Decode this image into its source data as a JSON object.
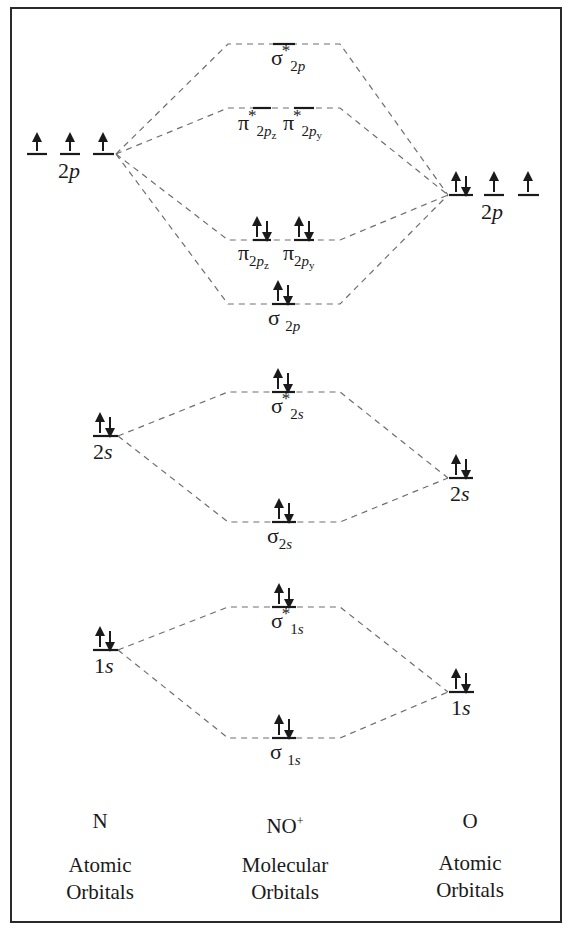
{
  "diagram": {
    "title_left": "N",
    "title_center": "NO",
    "title_center_charge": "+",
    "title_right": "O",
    "caption_left": [
      "Atomic",
      "Orbitals"
    ],
    "caption_center": [
      "Molecular",
      "Orbitals"
    ],
    "caption_right": [
      "Atomic",
      "Orbitals"
    ]
  },
  "atomic_orbitals": {
    "N": [
      {
        "name": "2p",
        "n": "2",
        "l": "p",
        "electrons": [
          "up",
          "up",
          "up"
        ]
      },
      {
        "name": "2s",
        "n": "2",
        "l": "s",
        "electrons": [
          "up-down"
        ]
      },
      {
        "name": "1s",
        "n": "1",
        "l": "s",
        "electrons": [
          "up-down"
        ]
      }
    ],
    "O": [
      {
        "name": "2p",
        "n": "2",
        "l": "p",
        "electrons": [
          "up-down",
          "up",
          "up"
        ]
      },
      {
        "name": "2s",
        "n": "2",
        "l": "s",
        "electrons": [
          "up-down"
        ]
      },
      {
        "name": "1s",
        "n": "1",
        "l": "s",
        "electrons": [
          "up-down"
        ]
      }
    ]
  },
  "molecular_orbitals": [
    {
      "symbol": "σ",
      "sub": "2p",
      "antibonding": true,
      "electrons": "empty"
    },
    {
      "symbol": "π",
      "sub": "2pz",
      "antibonding": true,
      "electrons": "empty"
    },
    {
      "symbol": "π",
      "sub": "2py",
      "antibonding": true,
      "electrons": "empty"
    },
    {
      "symbol": "π",
      "sub": "2pz",
      "antibonding": false,
      "electrons": "up-down"
    },
    {
      "symbol": "π",
      "sub": "2py",
      "antibonding": false,
      "electrons": "up-down"
    },
    {
      "symbol": "σ",
      "sub": "2p",
      "antibonding": false,
      "electrons": "up-down"
    },
    {
      "symbol": "σ",
      "sub": "2s",
      "antibonding": true,
      "electrons": "up-down"
    },
    {
      "symbol": "σ",
      "sub": "2s",
      "antibonding": false,
      "electrons": "up-down"
    },
    {
      "symbol": "σ",
      "sub": "1s",
      "antibonding": true,
      "electrons": "up-down"
    },
    {
      "symbol": "σ",
      "sub": "1s",
      "antibonding": false,
      "electrons": "up-down"
    }
  ],
  "labels": {
    "sigma": "σ",
    "pi": "π",
    "star": "*",
    "two": "2",
    "one": "1",
    "p": "p",
    "s": "s",
    "z": "z",
    "y": "y"
  },
  "colors": {
    "ink": "#1a1a1a",
    "dash": "#6e6e6e",
    "frame": "#2a2a2a"
  }
}
